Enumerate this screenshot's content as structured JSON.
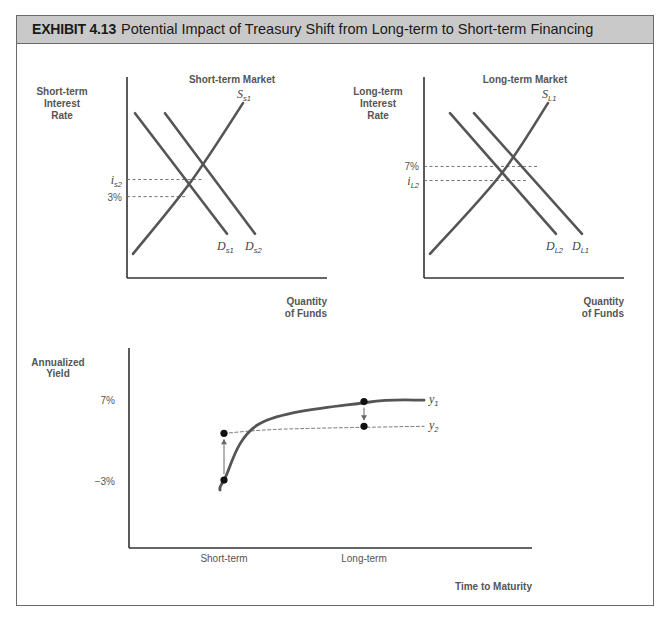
{
  "header": {
    "exhibit_number": "EXHIBIT 4.13",
    "title": "Potential Impact of Treasury Shift from Long-term to Short-term Financing",
    "background_color": "#c9c9c9"
  },
  "chart_data": [
    {
      "type": "line",
      "title": "Short-term Market",
      "ylabel": [
        "Short-term",
        "Interest",
        "Rate"
      ],
      "xlabel": [
        "Quantity",
        "of Funds"
      ],
      "grid": false,
      "ylim": [
        0,
        10
      ],
      "xlim": [
        0,
        10
      ],
      "series": [
        {
          "name": "Ss1",
          "label_main": "S",
          "label_sub": "s1",
          "kind": "supply",
          "style": "solid",
          "points": [
            [
              0.3,
              1.2
            ],
            [
              3.2,
              4.8
            ],
            [
              5.8,
              8.7
            ]
          ]
        },
        {
          "name": "Ds1",
          "label_main": "D",
          "label_sub": "s1",
          "kind": "demand",
          "style": "solid",
          "points": [
            [
              0.4,
              8.2
            ],
            [
              5.0,
              2.2
            ]
          ]
        },
        {
          "name": "Ds2",
          "label_main": "D",
          "label_sub": "s2",
          "kind": "demand",
          "style": "solid",
          "points": [
            [
              1.9,
              8.2
            ],
            [
              6.4,
              2.2
            ]
          ]
        }
      ],
      "reference_lines": [
        {
          "label_main": "i",
          "label_sub": "s2",
          "y": 4.9,
          "x_end": 3.8,
          "style": "dashed"
        },
        {
          "label_main": "3%",
          "label_sub": "",
          "y": 4.05,
          "x_end": 3.0,
          "style": "dashed"
        }
      ]
    },
    {
      "type": "line",
      "title": "Long-term Market",
      "ylabel": [
        "Long-term",
        "Interest",
        "Rate"
      ],
      "xlabel": [
        "Quantity",
        "of Funds"
      ],
      "grid": false,
      "ylim": [
        0,
        10
      ],
      "xlim": [
        0,
        10
      ],
      "series": [
        {
          "name": "SL1",
          "label_main": "S",
          "label_sub": "L1",
          "kind": "supply",
          "style": "solid",
          "points": [
            [
              0.3,
              1.2
            ],
            [
              3.8,
              5.1
            ],
            [
              6.2,
              8.7
            ]
          ]
        },
        {
          "name": "DL2",
          "label_main": "D",
          "label_sub": "L2",
          "kind": "demand",
          "style": "solid",
          "points": [
            [
              1.3,
              8.2
            ],
            [
              6.6,
              2.2
            ]
          ]
        },
        {
          "name": "DL1",
          "label_main": "D",
          "label_sub": "L1",
          "kind": "demand",
          "style": "solid",
          "points": [
            [
              2.5,
              8.2
            ],
            [
              7.9,
              2.2
            ]
          ]
        }
      ],
      "reference_lines": [
        {
          "label_main": "7%",
          "label_sub": "",
          "y": 5.55,
          "x_end": 5.7,
          "style": "dashed"
        },
        {
          "label_main": "i",
          "label_sub": "L2",
          "y": 4.85,
          "x_end": 5.1,
          "style": "dashed"
        }
      ]
    },
    {
      "type": "line",
      "title": "",
      "ylabel": [
        "Annualized",
        "Yield"
      ],
      "xlabel": "Time to Maturity",
      "x_tick_labels": [
        "Short-term",
        "Long-term"
      ],
      "y_tick_labels": [
        "7%",
        "−3%"
      ],
      "grid": false,
      "series": [
        {
          "name": "y1",
          "label_main": "y",
          "label_sub": "1",
          "style": "solid",
          "description": "Original yield curve, steeply rising at short term then flattening",
          "points": [
            [
              0.9,
              0.5
            ],
            [
              1.0,
              1.2
            ],
            [
              1.9,
              5.2
            ],
            [
              4.6,
              6.7
            ],
            [
              6.0,
              6.85
            ]
          ]
        },
        {
          "name": "y2",
          "label_main": "y",
          "label_sub": "2",
          "style": "dashed",
          "description": "Shifted yield curve, flatter",
          "points": [
            [
              1.0,
              4.5
            ],
            [
              2.5,
              4.8
            ],
            [
              6.0,
              5.0
            ]
          ]
        }
      ],
      "markers": [
        {
          "at": "Short-term",
          "from_series": "y1",
          "to_series": "y2",
          "from_y": 1.2,
          "to_y": 4.5,
          "direction": "up"
        },
        {
          "at": "Long-term",
          "from_series": "y1",
          "to_series": "y2",
          "from_y": 6.75,
          "to_y": 5.0,
          "direction": "down"
        }
      ]
    }
  ]
}
